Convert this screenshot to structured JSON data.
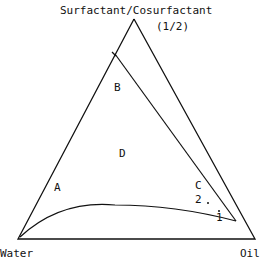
{
  "title": "Surfactant/Cosurfactant",
  "ratio": "(1/2)",
  "vertices": {
    "bottom_left": "Water",
    "bottom_right": "Oil"
  },
  "regions": [
    "A",
    "B",
    "C",
    "D"
  ],
  "points": [
    "1",
    "2"
  ],
  "colors": {
    "line": "#111111",
    "background": "#ffffff"
  }
}
